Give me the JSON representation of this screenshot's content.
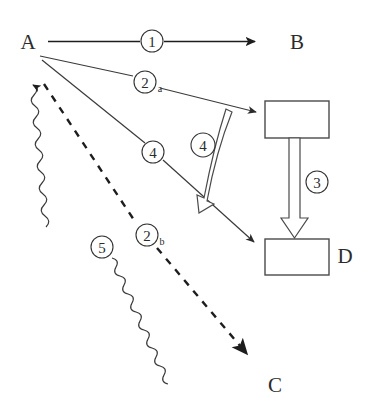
{
  "diagram": {
    "background_color": "#ffffff",
    "ink_color": "#1d1d1d",
    "nodes": [
      {
        "id": "A",
        "label": "A",
        "x": 28,
        "y": 42,
        "kind": "text-node"
      },
      {
        "id": "B",
        "label": "B",
        "x": 297,
        "y": 42,
        "kind": "text-node"
      },
      {
        "id": "C",
        "label": "C",
        "x": 275,
        "y": 385,
        "kind": "text-node"
      },
      {
        "id": "D",
        "label": "D",
        "x": 345,
        "y": 256,
        "kind": "text-node"
      }
    ],
    "boxes": [
      {
        "id": "box-top",
        "x": 265,
        "y": 101,
        "w": 64,
        "h": 37,
        "label": ""
      },
      {
        "id": "box-bottom",
        "x": 265,
        "y": 239,
        "w": 64,
        "h": 36,
        "label": ""
      }
    ],
    "edges": [
      {
        "id": "edge-1",
        "badge": "1",
        "sub": "",
        "from": "A",
        "to": "B",
        "style": "solid",
        "arrow": "filled",
        "badge_x": 152,
        "badge_y": 41
      },
      {
        "id": "edge-2a",
        "badge": "2",
        "sub": "a",
        "from": "A",
        "to": "box-top",
        "style": "thin",
        "arrow": "filled",
        "badge_x": 145,
        "badge_y": 82
      },
      {
        "id": "edge-4-thin",
        "badge": "4",
        "sub": "",
        "from": "A",
        "to": "box-bottom",
        "style": "thin",
        "arrow": "filled",
        "badge_x": 153,
        "badge_y": 152
      },
      {
        "id": "edge-4-curved",
        "badge": "4",
        "sub": "",
        "from": "box-top",
        "to": "edge-4-thin",
        "style": "hollow-curved",
        "arrow": "hollow",
        "badge_x": 203,
        "badge_y": 145
      },
      {
        "id": "edge-3",
        "badge": "3",
        "sub": "",
        "from": "box-top",
        "to": "box-bottom",
        "style": "hollow-straight",
        "arrow": "hollow",
        "badge_x": 317,
        "badge_y": 182
      },
      {
        "id": "edge-2b",
        "badge": "2",
        "sub": "b",
        "from": "A",
        "to": "C",
        "style": "dashed",
        "arrow": "filled",
        "badge_x": 147,
        "badge_y": 235
      },
      {
        "id": "edge-5",
        "badge": "5",
        "sub": "",
        "from": "C",
        "to": "A",
        "style": "wavy",
        "arrow": "filled",
        "badge_x": 102,
        "badge_y": 247
      }
    ],
    "legend_numbers": [
      "1",
      "2a",
      "4",
      "3",
      "2b",
      "5"
    ]
  }
}
